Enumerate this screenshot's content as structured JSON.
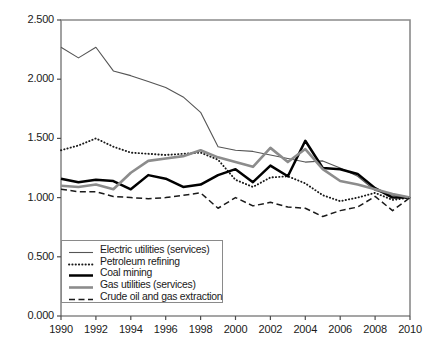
{
  "chart_data": {
    "type": "line",
    "title": "",
    "xlabel": "",
    "ylabel": "",
    "xlim": [
      1990,
      2010
    ],
    "ylim": [
      0.0,
      2.5
    ],
    "grid": false,
    "legend_position": "lower-left-inside",
    "x": [
      1990,
      1991,
      1992,
      1993,
      1994,
      1995,
      1996,
      1997,
      1998,
      1999,
      2000,
      2001,
      2002,
      2003,
      2004,
      2005,
      2006,
      2007,
      2008,
      2009,
      2010
    ],
    "x_tick_labels": [
      "1990",
      "1992",
      "1994",
      "1996",
      "1998",
      "2000",
      "2002",
      "2004",
      "2006",
      "2008",
      "2010"
    ],
    "y_tick_labels": [
      "0.000",
      "0.500",
      "1.000",
      "1.500",
      "2.000",
      "2.500"
    ],
    "y_tick_values": [
      0.0,
      0.5,
      1.0,
      1.5,
      2.0,
      2.5
    ],
    "series": [
      {
        "name": "Electric utilities (services)",
        "style": "thin-solid-gray",
        "color": "#555555",
        "values": [
          2.27,
          2.18,
          2.27,
          2.07,
          2.03,
          1.98,
          1.93,
          1.85,
          1.72,
          1.43,
          1.4,
          1.39,
          1.36,
          1.33,
          1.3,
          1.31,
          1.25,
          1.18,
          1.06,
          1.02,
          1.0
        ]
      },
      {
        "name": "Petroleum refining",
        "style": "dotted",
        "color": "#1a1a1a",
        "values": [
          1.4,
          1.44,
          1.5,
          1.43,
          1.38,
          1.37,
          1.36,
          1.37,
          1.38,
          1.32,
          1.15,
          1.09,
          1.17,
          1.18,
          1.12,
          1.02,
          0.97,
          1.0,
          1.04,
          0.98,
          1.0
        ]
      },
      {
        "name": "Coal mining",
        "style": "thick-solid-black",
        "color": "#000000",
        "values": [
          1.16,
          1.13,
          1.15,
          1.14,
          1.07,
          1.19,
          1.16,
          1.09,
          1.11,
          1.19,
          1.24,
          1.13,
          1.27,
          1.18,
          1.48,
          1.25,
          1.24,
          1.2,
          1.08,
          1.0,
          1.0
        ]
      },
      {
        "name": "Gas utilities (services)",
        "style": "thick-solid-gray",
        "color": "#8c8c8c",
        "values": [
          1.1,
          1.09,
          1.11,
          1.07,
          1.21,
          1.31,
          1.33,
          1.35,
          1.4,
          1.34,
          1.3,
          1.26,
          1.42,
          1.3,
          1.41,
          1.24,
          1.14,
          1.11,
          1.07,
          1.03,
          1.0
        ]
      },
      {
        "name": "Crude oil and gas extraction",
        "style": "dashed",
        "color": "#1a1a1a",
        "values": [
          1.07,
          1.05,
          1.05,
          1.01,
          1.0,
          0.99,
          1.0,
          1.02,
          1.04,
          0.91,
          1.0,
          0.93,
          0.96,
          0.92,
          0.91,
          0.84,
          0.89,
          0.92,
          1.01,
          0.89,
          1.0
        ]
      }
    ]
  },
  "axes": {
    "plot_left": 61,
    "plot_right": 410,
    "plot_top": 20,
    "plot_bottom": 316
  },
  "legend": {
    "items": [
      {
        "label": "Electric utilities (services)"
      },
      {
        "label": "Petroleum refining"
      },
      {
        "label": "Coal mining"
      },
      {
        "label": "Gas utilities (services)"
      },
      {
        "label": "Crude oil and gas extraction"
      }
    ]
  }
}
